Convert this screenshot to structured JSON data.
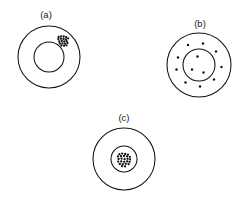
{
  "figure": {
    "background_color": "#ffffff",
    "line_color": "#111111",
    "particle_color": "#111111",
    "width": 249,
    "height": 201,
    "panels": [
      {
        "id": "panel-a",
        "label": "(a)",
        "label_x": 46,
        "label_y": 18,
        "center_x": 49,
        "center_y": 57,
        "outer_radius": 31,
        "inner_radius": 15,
        "inner_filled": false,
        "description": "aggregated cluster in outer shell",
        "cluster": {
          "center_x": 63.5,
          "center_y": 40.5,
          "dot_radius": 1.15,
          "dots": [
            [
              -4.8,
              -3.6
            ],
            [
              -2.4,
              -4.2
            ],
            [
              0.2,
              -4.0
            ],
            [
              2.6,
              -3.4
            ],
            [
              -5.2,
              -1.4
            ],
            [
              -2.6,
              -1.8
            ],
            [
              0.0,
              -1.6
            ],
            [
              2.4,
              -1.2
            ],
            [
              4.6,
              -2.2
            ],
            [
              -4.4,
              0.8
            ],
            [
              -1.8,
              0.5
            ],
            [
              0.8,
              0.9
            ],
            [
              3.2,
              0.6
            ],
            [
              -3.6,
              3.0
            ],
            [
              -1.0,
              2.8
            ],
            [
              1.6,
              3.2
            ],
            [
              4.0,
              2.4
            ],
            [
              -2.0,
              5.0
            ],
            [
              0.6,
              5.2
            ],
            [
              3.0,
              4.8
            ]
          ]
        },
        "scattered_particles": []
      },
      {
        "id": "panel-b",
        "label": "(b)",
        "label_x": 200,
        "label_y": 27,
        "center_x": 199,
        "center_y": 65,
        "outer_radius": 32,
        "inner_radius": 16,
        "inner_filled": false,
        "description": "dispersed particles in shell and core",
        "cluster": null,
        "scattered_particles": [
          {
            "x": -11.0,
            "y": -20.0,
            "r": 1.2
          },
          {
            "x": 4.0,
            "y": -21.5,
            "r": 1.2
          },
          {
            "x": 17.0,
            "y": -13.5,
            "r": 1.2
          },
          {
            "x": 22.5,
            "y": 2.0,
            "r": 1.2
          },
          {
            "x": 15.0,
            "y": 14.5,
            "r": 1.2
          },
          {
            "x": 1.0,
            "y": 21.5,
            "r": 1.2
          },
          {
            "x": -13.5,
            "y": 17.5,
            "r": 1.2
          },
          {
            "x": -22.5,
            "y": 4.5,
            "r": 1.2
          },
          {
            "x": -21.0,
            "y": -7.5,
            "r": 1.2
          },
          {
            "x": -1.5,
            "y": -8.5,
            "r": 1.2
          },
          {
            "x": -7.0,
            "y": 4.5,
            "r": 1.2
          },
          {
            "x": 4.5,
            "y": 7.5,
            "r": 1.2
          }
        ]
      },
      {
        "id": "panel-c",
        "label": "(c)",
        "label_x": 124,
        "label_y": 121,
        "center_x": 124,
        "center_y": 159,
        "outer_radius": 31,
        "inner_radius": 13,
        "inner_filled": true,
        "description": "aggregated cluster in core",
        "cluster": {
          "center_x": 124,
          "center_y": 159,
          "dot_radius": 1.15,
          "dots": [
            [
              -4.6,
              -4.8
            ],
            [
              -1.8,
              -5.4
            ],
            [
              1.2,
              -5.0
            ],
            [
              4.0,
              -4.4
            ],
            [
              -6.0,
              -2.6
            ],
            [
              -3.0,
              -2.8
            ],
            [
              0.0,
              -3.0
            ],
            [
              3.0,
              -2.6
            ],
            [
              5.8,
              -2.2
            ],
            [
              -5.4,
              0.0
            ],
            [
              -2.4,
              -0.4
            ],
            [
              0.6,
              0.2
            ],
            [
              3.6,
              -0.2
            ],
            [
              6.0,
              0.4
            ],
            [
              -5.8,
              2.6
            ],
            [
              -2.8,
              2.4
            ],
            [
              0.2,
              2.8
            ],
            [
              3.2,
              2.4
            ],
            [
              5.6,
              2.8
            ],
            [
              -4.2,
              5.0
            ],
            [
              -1.2,
              5.2
            ],
            [
              1.8,
              4.8
            ],
            [
              4.6,
              5.2
            ],
            [
              -2.0,
              7.2
            ],
            [
              1.0,
              7.4
            ]
          ]
        },
        "scattered_particles": []
      }
    ]
  }
}
